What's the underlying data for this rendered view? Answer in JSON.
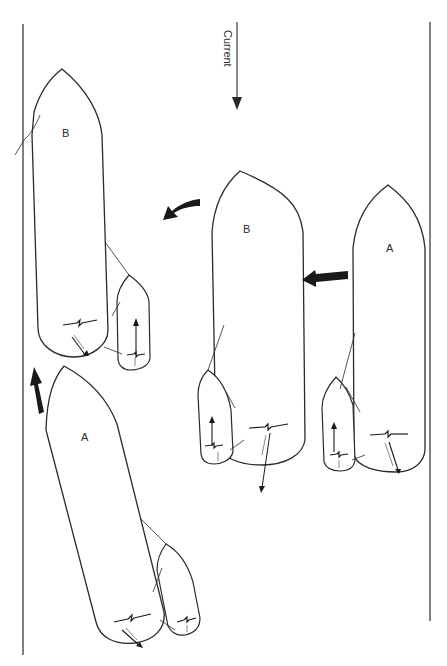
{
  "figure": {
    "current_label": "Current",
    "ships": [
      {
        "id": "ship-b-left",
        "label": "B"
      },
      {
        "id": "ship-b-middle",
        "label": "B"
      },
      {
        "id": "ship-a-right",
        "label": "A"
      },
      {
        "id": "ship-a-bottom",
        "label": "A"
      }
    ],
    "colors": {
      "ink": "#2a2a2a",
      "background": "#ffffff"
    }
  }
}
